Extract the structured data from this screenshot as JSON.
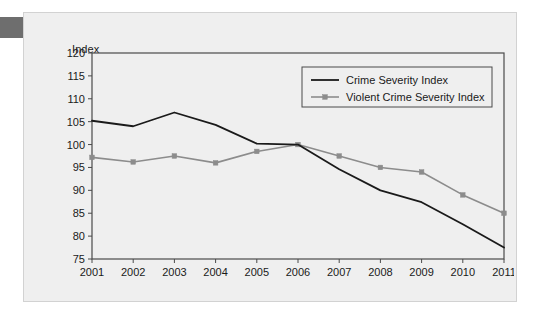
{
  "figure": {
    "axis_label": "Index",
    "panel_background": "#efefef",
    "page_background": "#ffffff",
    "corner_tab_color": "#6e6e6e"
  },
  "chart_data": {
    "type": "line",
    "title": "",
    "subtitle": "",
    "xlabel": "",
    "ylabel": "Index",
    "categories": [
      "2001",
      "2002",
      "2003",
      "2004",
      "2005",
      "2006",
      "2007",
      "2008",
      "2009",
      "2010",
      "2011"
    ],
    "xlim": [
      2001,
      2011
    ],
    "ylim": [
      75,
      120
    ],
    "yticks": [
      75,
      80,
      85,
      90,
      95,
      100,
      105,
      110,
      115,
      120
    ],
    "ytick_labels": [
      "75",
      "80",
      "85",
      "90",
      "95",
      "100",
      "105",
      "110",
      "115",
      "120"
    ],
    "xticks": [
      2001,
      2002,
      2003,
      2004,
      2005,
      2006,
      2007,
      2008,
      2009,
      2010,
      2011
    ],
    "grid": false,
    "legend_position": "top-right",
    "series": [
      {
        "name": "Crime Severity Index",
        "color": "#1a1a1a",
        "marker": "none",
        "line_width": 1.8,
        "values": [
          105.2,
          104.0,
          107.0,
          104.3,
          100.2,
          100.0,
          94.6,
          90.0,
          87.4,
          82.6,
          77.5
        ]
      },
      {
        "name": "Violent Crime Severity Index",
        "color": "#8c8c8c",
        "marker": "square",
        "line_width": 1.6,
        "values": [
          97.2,
          96.2,
          97.5,
          96.0,
          98.5,
          100.0,
          97.5,
          95.0,
          94.0,
          89.0,
          85.0
        ]
      }
    ]
  },
  "legend": {
    "items": [
      {
        "label": "Crime Severity Index"
      },
      {
        "label": "Violent Crime Severity Index"
      }
    ]
  }
}
